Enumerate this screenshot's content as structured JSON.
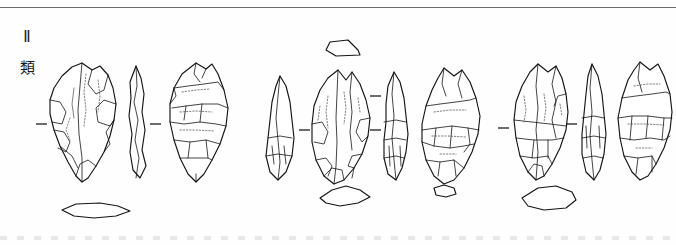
{
  "plate": {
    "name": "lithic-artifact-plate",
    "background_color": "#fefefe",
    "ink_color": "#1a1a1a",
    "rule_color": "#6a6a6a",
    "width": 676,
    "height": 245
  },
  "labels": {
    "type_numeral": "Ⅱ",
    "type_kanji": "類"
  },
  "figure": {
    "caption": "",
    "illustration_type": "archaeological-line-drawing",
    "group_count": 3,
    "views_per_group": 3,
    "tick_mark_glyph": "–"
  },
  "groups": [
    {
      "id": "group-1",
      "label": "",
      "views": [
        {
          "id": "g1-obverse",
          "name": "obverse-view",
          "x": 48,
          "y": 62,
          "w": 68,
          "h": 120
        },
        {
          "id": "g1-profile",
          "name": "profile-view",
          "x": 122,
          "y": 66,
          "w": 30,
          "h": 112
        },
        {
          "id": "g1-reverse",
          "name": "reverse-view",
          "x": 160,
          "y": 62,
          "w": 70,
          "h": 120
        }
      ],
      "tick_marks": [
        {
          "id": "g1-tick-left",
          "x": 38,
          "y": 124
        },
        {
          "id": "g1-tick-right",
          "x": 150,
          "y": 124
        }
      ],
      "cross_sections": [
        {
          "id": "g1-section-bottom",
          "name": "cross-section-lenticular",
          "x": 58,
          "y": 204
        }
      ]
    },
    {
      "id": "group-2",
      "label": "",
      "views": [
        {
          "id": "g2-profile-left",
          "name": "profile-view",
          "x": 262,
          "y": 78,
          "w": 38,
          "h": 105
        },
        {
          "id": "g2-obverse",
          "name": "obverse-view",
          "x": 308,
          "y": 74,
          "w": 62,
          "h": 112
        },
        {
          "id": "g2-profile-right",
          "name": "profile-view",
          "x": 378,
          "y": 74,
          "w": 32,
          "h": 110
        },
        {
          "id": "g2-reverse",
          "name": "reverse-view",
          "x": 418,
          "y": 70,
          "w": 64,
          "h": 116
        }
      ],
      "tick_marks": [
        {
          "id": "g2-tick-left",
          "x": 302,
          "y": 128
        },
        {
          "id": "g2-tick-mid",
          "x": 370,
          "y": 128
        },
        {
          "id": "g2-tick-upper",
          "x": 370,
          "y": 96
        }
      ],
      "cross_sections": [
        {
          "id": "g2-section-top",
          "name": "cross-section-trapezoid",
          "x": 326,
          "y": 46
        },
        {
          "id": "g2-section-bottom",
          "name": "cross-section-polygon",
          "x": 318,
          "y": 192
        },
        {
          "id": "g2-section-right",
          "name": "cross-section-small",
          "x": 432,
          "y": 190
        }
      ]
    },
    {
      "id": "group-3",
      "label": "",
      "views": [
        {
          "id": "g3-obverse",
          "name": "obverse-view",
          "x": 508,
          "y": 66,
          "w": 64,
          "h": 112
        },
        {
          "id": "g3-profile",
          "name": "profile-view",
          "x": 578,
          "y": 66,
          "w": 34,
          "h": 112
        },
        {
          "id": "g3-reverse",
          "name": "reverse-view",
          "x": 612,
          "y": 62,
          "w": 58,
          "h": 118
        }
      ],
      "tick_marks": [
        {
          "id": "g3-tick-left",
          "x": 500,
          "y": 128
        },
        {
          "id": "g3-tick-right",
          "x": 568,
          "y": 124
        }
      ],
      "cross_sections": [
        {
          "id": "g3-section-bottom",
          "name": "cross-section-pentagonal",
          "x": 522,
          "y": 188
        }
      ]
    }
  ]
}
